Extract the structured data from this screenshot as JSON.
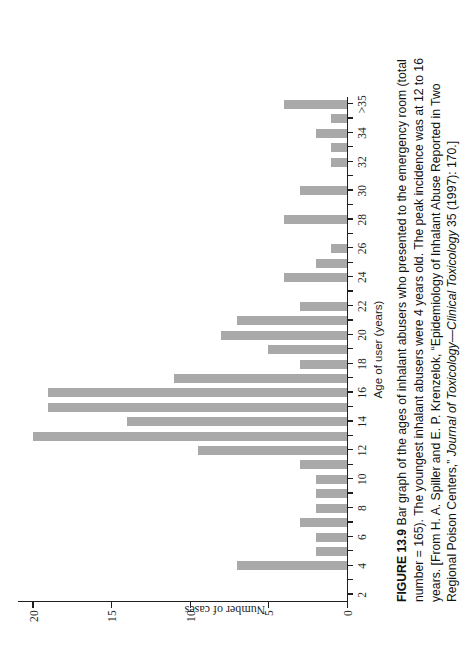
{
  "figure": {
    "label": "FIGURE 13.9",
    "caption_text": "  Bar graph of the ages of inhalant abusers who presented to the emergency room (total number = 165). The youngest inhalant abusers were 4 years old. The peak incidence was at 12 to 16 years. [From H. A. Spiller and E. P. Krenzelok, “Epidemiology of Inhalant Abuse Reported in Two Regional Poison Centers,” ",
    "caption_italic": "Journal of Toxicology—Clinical Toxicology",
    "caption_tail": " 35 (1997): 170.]",
    "total_number": "165",
    "youngest_age": "4",
    "peak_range": "12 to 16",
    "source_authors": "H. A. Spiller and E. P. Krenzelok",
    "source_article": "“Epidemiology of Inhalant Abuse Reported in Two Regional Poison Centers,”",
    "source_journal": "Journal of Toxicology—Clinical Toxicology",
    "source_volume": "35",
    "source_year": "1997",
    "source_page": "170"
  },
  "colors": {
    "bar": "#a9a9a9",
    "axis": "#1f1f1f",
    "background": "#ffffff",
    "text": "#111111"
  },
  "chart_data": {
    "type": "bar",
    "title": "",
    "xlabel": "Age of user (years)",
    "ylabel": "Number of cases",
    "orientation": "vertical",
    "grid": false,
    "legend": null,
    "ylim": [
      0,
      21
    ],
    "yticks": [
      0,
      5,
      10,
      15,
      20
    ],
    "ytick_labels": [
      "0",
      "5",
      "10",
      "15",
      "20"
    ],
    "xtick_labels": [
      "2",
      "4",
      "6",
      "8",
      "10",
      "12",
      "14",
      "16",
      "18",
      "20",
      "22",
      "24",
      "26",
      "28",
      "30",
      "32",
      "34",
      ">35"
    ],
    "categories": [
      "2",
      "3",
      "4",
      "5",
      "6",
      "7",
      "8",
      "9",
      "10",
      "11",
      "12",
      "13",
      "14",
      "15",
      "16",
      "17",
      "18",
      "19",
      "20",
      "21",
      "22",
      "23",
      "24",
      "25",
      "26",
      "27",
      "28",
      "29",
      "30",
      "31",
      "32",
      "33",
      "34",
      "35",
      ">35"
    ],
    "values": [
      0,
      0,
      7,
      2,
      2,
      3,
      2,
      2,
      2,
      3,
      9.5,
      20,
      14,
      19,
      19,
      11,
      3,
      5,
      8,
      7,
      3,
      0,
      4,
      2,
      1,
      0,
      4,
      0,
      3,
      0,
      1,
      1,
      2,
      1,
      4
    ]
  }
}
